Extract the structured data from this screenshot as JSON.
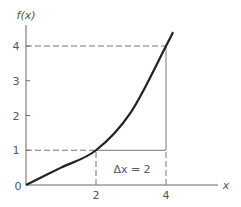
{
  "chart_data": {
    "type": "line",
    "title": "",
    "xlabel": "x",
    "ylabel": "f(x)",
    "xlim": [
      0,
      5.2
    ],
    "ylim": [
      0,
      4.5
    ],
    "x_ticks": [
      {
        "value": 2,
        "label": "2"
      },
      {
        "value": 4,
        "label": "4"
      }
    ],
    "y_ticks": [
      {
        "value": 0,
        "label": "0"
      },
      {
        "value": 1,
        "label": "1"
      },
      {
        "value": 2,
        "label": "2"
      },
      {
        "value": 3,
        "label": "3"
      },
      {
        "value": 4,
        "label": "4"
      }
    ],
    "grid": false,
    "series": [
      {
        "name": "f(x)",
        "x": [
          0,
          1,
          2,
          3,
          4,
          4.2
        ],
        "y": [
          0,
          0.5,
          1,
          2.1,
          4,
          4.4
        ]
      }
    ],
    "annotations": [
      {
        "type": "dashed-line",
        "from": [
          0,
          4
        ],
        "to": [
          4,
          4
        ]
      },
      {
        "type": "dashed-line",
        "from": [
          0,
          1
        ],
        "to": [
          2,
          1
        ]
      },
      {
        "type": "dashed-line",
        "from": [
          2,
          0
        ],
        "to": [
          2,
          1
        ]
      },
      {
        "type": "solid-line",
        "from": [
          2,
          1
        ],
        "to": [
          4,
          1
        ]
      },
      {
        "type": "solid-line",
        "from": [
          4,
          1
        ],
        "to": [
          4,
          4
        ]
      },
      {
        "type": "dashed-line",
        "from": [
          4,
          0
        ],
        "to": [
          4,
          1
        ]
      },
      {
        "type": "text",
        "text": "Δx = 2",
        "at": [
          3,
          0.45
        ]
      }
    ]
  },
  "labels": {
    "ylabel": "f(x)",
    "xlabel": "x",
    "origin": "0",
    "delta": "Δx = 2"
  }
}
